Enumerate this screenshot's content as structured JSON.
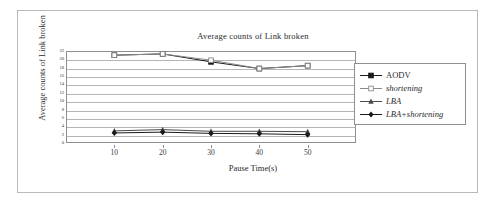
{
  "figure": {
    "title": "Average counts of Link broken",
    "xlabel": "Pause Time(s)",
    "ylabel": "Average counts of Link broken"
  },
  "legend": {
    "items": [
      {
        "label": "AODV",
        "marker": "filled-square-marker",
        "italic": false,
        "color": "#1a1a1a"
      },
      {
        "label": "shortening",
        "marker": "open-square-marker",
        "italic": true,
        "color": "#8a8a8a"
      },
      {
        "label": "LBA",
        "marker": "filled-triangle-marker",
        "italic": true,
        "color": "#4a4a4a"
      },
      {
        "label": "LBA+shortening",
        "marker": "filled-diamond-marker",
        "italic": true,
        "color": "#1a1a1a"
      }
    ]
  },
  "chart_data": {
    "type": "line",
    "title": "Average counts of Link broken",
    "xlabel": "Pause Time(s)",
    "ylabel": "Average counts of Link broken",
    "x": [
      10,
      20,
      30,
      40,
      50
    ],
    "xticklabels": [
      "10",
      "20",
      "30",
      "40",
      "50"
    ],
    "yticklabels": [
      "22",
      "20",
      "18",
      "16",
      "14",
      "12",
      "10",
      "8",
      "6",
      "4",
      "2",
      "0"
    ],
    "ylim": [
      0,
      22
    ],
    "xlim": [
      0,
      60
    ],
    "grid": true,
    "legend_position": "right",
    "series": [
      {
        "name": "AODV",
        "values": [
          21.0,
          21.3,
          19.4,
          17.8,
          18.5
        ]
      },
      {
        "name": "shortening",
        "values": [
          21.0,
          21.3,
          19.8,
          17.8,
          18.5
        ]
      },
      {
        "name": "LBA",
        "values": [
          2.9,
          3.2,
          2.8,
          2.8,
          2.7
        ]
      },
      {
        "name": "LBA+shortening",
        "values": [
          2.4,
          2.6,
          2.3,
          2.2,
          2.0
        ]
      }
    ]
  }
}
